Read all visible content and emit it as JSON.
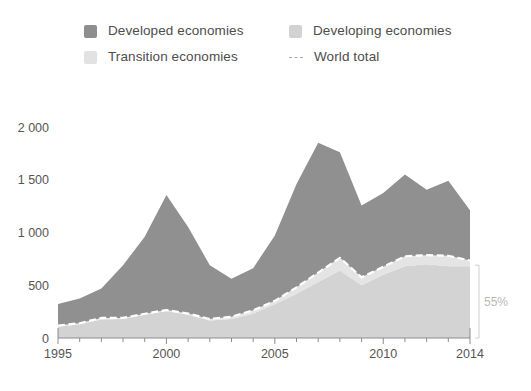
{
  "legend": {
    "items": [
      {
        "key": "developed",
        "label": "Developed economies",
        "marker": "square-swatch",
        "color": "#8e8e8e"
      },
      {
        "key": "developing",
        "label": "Developing economies",
        "marker": "square-swatch",
        "color": "#d2d2d2"
      },
      {
        "key": "transition",
        "label": "Transition economies",
        "marker": "square-swatch",
        "color": "#e2e2e2"
      },
      {
        "key": "world",
        "label": "World total",
        "marker": "dashed-line",
        "color": "#ffffff"
      }
    ]
  },
  "annotations": [
    {
      "name": "share-bracket",
      "text": "55%",
      "x_value": 2014,
      "from_value": 0,
      "to_value": 690
    }
  ],
  "axis": {
    "y_ticks": [
      "0",
      "500",
      "1 000",
      "1 500",
      "2 000"
    ],
    "x_ticks": [
      "1995",
      "2000",
      "2005",
      "2010",
      "2014"
    ]
  },
  "chart_data": {
    "type": "area",
    "stacked": true,
    "title": "",
    "subtitle": "",
    "xlabel": "",
    "ylabel": "",
    "xlim": [
      1995,
      2014
    ],
    "ylim": [
      0,
      2000
    ],
    "ytick_step": 500,
    "grid": false,
    "legend_position": "top",
    "x": [
      1995,
      1996,
      1997,
      1998,
      1999,
      2000,
      2001,
      2002,
      2003,
      2004,
      2005,
      2006,
      2007,
      2008,
      2009,
      2010,
      2011,
      2012,
      2013,
      2014
    ],
    "series": [
      {
        "name": "Developing economies",
        "color": "#d3d3d3",
        "stack_order": 1,
        "values": [
          110,
          130,
          175,
          180,
          220,
          255,
          220,
          165,
          180,
          230,
          320,
          420,
          530,
          640,
          500,
          600,
          680,
          700,
          680,
          680
        ]
      },
      {
        "name": "Transition economies",
        "color": "#e4e4e4",
        "stack_order": 2,
        "values": [
          8,
          10,
          15,
          10,
          10,
          10,
          12,
          15,
          22,
          32,
          32,
          60,
          90,
          120,
          75,
          75,
          95,
          85,
          100,
          55
        ]
      },
      {
        "name": "Developed economies",
        "color": "#909090",
        "stack_order": 3,
        "values": [
          205,
          235,
          280,
          500,
          730,
          1090,
          820,
          510,
          360,
          400,
          620,
          980,
          1230,
          1000,
          680,
          700,
          775,
          620,
          710,
          475
        ]
      }
    ],
    "line_series": [
      {
        "name": "World total",
        "color": "#ffffff",
        "style": "dashed",
        "note": "equals stacked total of developing + transition",
        "values": [
          118,
          140,
          190,
          190,
          230,
          265,
          232,
          180,
          202,
          262,
          352,
          480,
          620,
          760,
          575,
          675,
          775,
          785,
          780,
          735
        ]
      }
    ],
    "totals": [
      323,
      375,
      470,
      690,
      960,
      1355,
      1052,
      690,
      562,
      662,
      972,
      1460,
      1850,
      1760,
      1255,
      1375,
      1550,
      1405,
      1490,
      1210
    ]
  }
}
